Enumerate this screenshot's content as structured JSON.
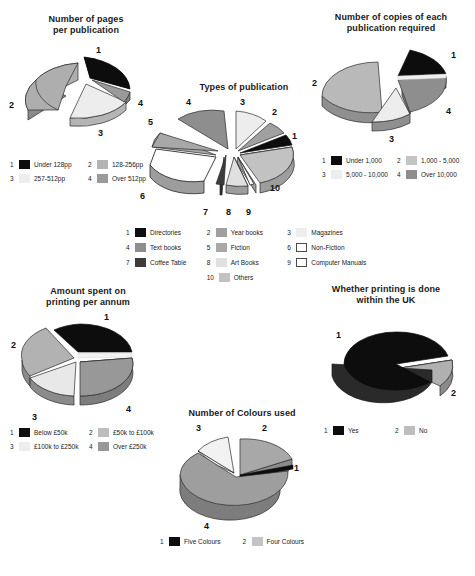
{
  "page": {
    "background": "#ffffff",
    "kind": "six-pie-chart-figure"
  },
  "palette": {
    "black": "#0d0d0d",
    "dark_gray": "#4a4a4a",
    "mid_gray": "#8e8e8e",
    "light_gray": "#c9c9c9",
    "pale_gray": "#e4e4e4",
    "white": "#ffffff",
    "edge": "#2b2b2b"
  },
  "charts": [
    {
      "id": "pages-per-publication",
      "title_line1": "Number of pages",
      "title_line2": "per publication",
      "type": "pie",
      "labels": [
        "1",
        "2",
        "3",
        "4"
      ],
      "categories": [
        "Under 128pp",
        "128-256pp",
        "257-512pp",
        "Over 512pp"
      ],
      "values": [
        27,
        31,
        30,
        12
      ],
      "colors": [
        "#0d0d0d",
        "#aeaeae",
        "#ededed",
        "#9a9a9a"
      ],
      "legend": [
        {
          "num": "1",
          "label": "Under 128pp",
          "color": "#0d0d0d"
        },
        {
          "num": "2",
          "label": "128-256pp",
          "color": "#b4b4b4"
        },
        {
          "num": "3",
          "label": "257-512pp",
          "color": "#ededed"
        },
        {
          "num": "4",
          "label": "Over 512pp",
          "color": "#9a9a9a"
        }
      ]
    },
    {
      "id": "copies-required",
      "title_line1": "Number of copies of each",
      "title_line2": "publication required",
      "type": "pie",
      "labels": [
        "1",
        "2",
        "3",
        "4"
      ],
      "categories": [
        "Under 1,000",
        "1,000 - 5,000",
        "5,000 - 10,000",
        "Over 10,000"
      ],
      "values": [
        16,
        48,
        15,
        21
      ],
      "colors": [
        "#0d0d0d",
        "#b9b9b9",
        "#ededed",
        "#8e8e8e"
      ],
      "legend": [
        {
          "num": "1",
          "label": "Under 1,000",
          "color": "#0d0d0d"
        },
        {
          "num": "2",
          "label": "1,000 - 5,000",
          "color": "#c4c4c4"
        },
        {
          "num": "3",
          "label": "5,000 - 10,000",
          "color": "#ededed"
        },
        {
          "num": "4",
          "label": "Over 10,000",
          "color": "#8e8e8e"
        }
      ]
    },
    {
      "id": "types-of-publication",
      "title_line1": "Types of publication",
      "title_line2": "",
      "type": "pie",
      "labels": [
        "1",
        "2",
        "3",
        "4",
        "5",
        "6",
        "7",
        "8",
        "9",
        "10"
      ],
      "categories": [
        "Directories",
        "Year books",
        "Magazines",
        "Text books",
        "Fiction",
        "Non-Fiction",
        "Coffee Table",
        "Art Books",
        "Computer Manuals",
        "Others"
      ],
      "values": [
        5,
        6,
        10,
        13,
        7,
        20,
        4,
        9,
        3,
        23
      ],
      "colors": [
        "#0d0d0d",
        "#a0a0a0",
        "#ededed",
        "#8e8e8e",
        "#a8a8a8",
        "#ffffff",
        "#3c3c3c",
        "#e0e0e0",
        "#ffffff",
        "#c2c2c2"
      ],
      "legend": [
        {
          "num": "1",
          "label": "Directories",
          "color": "#0d0d0d"
        },
        {
          "num": "2",
          "label": "Year books",
          "color": "#a0a0a0"
        },
        {
          "num": "3",
          "label": "Magazines",
          "color": "#ededed"
        },
        {
          "num": "4",
          "label": "Text books",
          "color": "#8e8e8e"
        },
        {
          "num": "5",
          "label": "Fiction",
          "color": "#a8a8a8"
        },
        {
          "num": "6",
          "label": "Non-Fiction",
          "color": "#ffffff"
        },
        {
          "num": "7",
          "label": "Coffee Table",
          "color": "#3c3c3c"
        },
        {
          "num": "8",
          "label": "Art Books",
          "color": "#e0e0e0"
        },
        {
          "num": "9",
          "label": "Computer Manuals",
          "color": "#ffffff"
        },
        {
          "num": "10",
          "label": "Others",
          "color": "#c2c2c2"
        }
      ]
    },
    {
      "id": "amount-spent-printing",
      "title_line1": "Amount spent on",
      "title_line2": "printing per annum",
      "type": "pie",
      "labels": [
        "1",
        "2",
        "3",
        "4"
      ],
      "categories": [
        "Below £50k",
        "£50k to £100k",
        "£100k to £250k",
        "Over £250k"
      ],
      "values": [
        25,
        22,
        20,
        33
      ],
      "colors": [
        "#0d0d0d",
        "#b2b2b2",
        "#e8e8e8",
        "#989898"
      ],
      "legend": [
        {
          "num": "1",
          "label": "Below £50k",
          "color": "#0d0d0d"
        },
        {
          "num": "2",
          "label": "£50k to £100k",
          "color": "#bdbdbd"
        },
        {
          "num": "3",
          "label": "£100k to £250k",
          "color": "#ededed"
        },
        {
          "num": "4",
          "label": "Over £250k",
          "color": "#989898"
        }
      ]
    },
    {
      "id": "printing-within-uk",
      "title_line1": "Whether printing is done",
      "title_line2": "within the UK",
      "type": "pie",
      "labels": [
        "1",
        "2"
      ],
      "categories": [
        "Yes",
        "No"
      ],
      "values": [
        86,
        14
      ],
      "colors": [
        "#0d0d0d",
        "#b0b0b0"
      ],
      "legend": [
        {
          "num": "1",
          "label": "Yes",
          "color": "#0d0d0d"
        },
        {
          "num": "2",
          "label": "No",
          "color": "#bdbdbd"
        }
      ]
    },
    {
      "id": "number-of-colours",
      "title_line1": "Number of Colours used",
      "title_line2": "",
      "type": "pie",
      "labels": [
        "1",
        "2",
        "3",
        "4"
      ],
      "categories": [
        "Five Colours",
        "Four Colours",
        "",
        ""
      ],
      "values": [
        2,
        25,
        13,
        60
      ],
      "colors": [
        "#0d0d0d",
        "#a8a8a8",
        "#f2f2f2",
        "#9e9e9e"
      ],
      "legend": [
        {
          "num": "1",
          "label": "Five Colours",
          "color": "#0d0d0d"
        },
        {
          "num": "2",
          "label": "Four Colours",
          "color": "#c4c4c4"
        }
      ]
    }
  ]
}
